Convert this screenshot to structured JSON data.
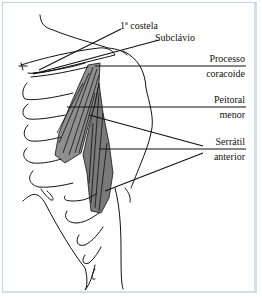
{
  "figure": {
    "labels": {
      "costela": "1ª costela",
      "subclavio": "Subclávio",
      "processo_l1": "Processo",
      "processo_l2": "coracoide",
      "peitoral_l1": "Peitoral",
      "peitoral_l2": "menor",
      "serratil_l1": "Serrátil",
      "serratil_l2": "anterior"
    },
    "colors": {
      "border": "#c5d3de",
      "ink": "#111111"
    }
  }
}
